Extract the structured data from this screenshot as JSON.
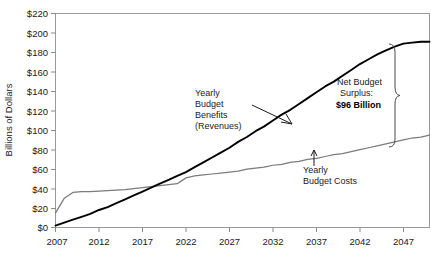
{
  "chart_data": {
    "type": "line",
    "title": "",
    "xlabel": "",
    "ylabel": "Billions of Dollars",
    "xlim": [
      2007,
      2050
    ],
    "ylim": [
      0,
      220
    ],
    "grid": false,
    "legend_position": "none",
    "x_ticks": [
      "2007",
      "2012",
      "2017",
      "2022",
      "2027",
      "2032",
      "2037",
      "2042",
      "2047"
    ],
    "x_tick_values": [
      2007,
      2012,
      2017,
      2022,
      2027,
      2032,
      2037,
      2042,
      2047
    ],
    "y_ticks": [
      "$0",
      "$20",
      "$40",
      "$60",
      "$80",
      "$100",
      "$120",
      "$140",
      "$160",
      "$180",
      "$200",
      "$220"
    ],
    "y_tick_values": [
      0,
      20,
      40,
      60,
      80,
      100,
      120,
      140,
      160,
      180,
      200,
      220
    ],
    "x": [
      2007,
      2008,
      2009,
      2010,
      2011,
      2012,
      2013,
      2014,
      2015,
      2016,
      2017,
      2018,
      2019,
      2020,
      2021,
      2022,
      2023,
      2024,
      2025,
      2026,
      2027,
      2028,
      2029,
      2030,
      2031,
      2032,
      2033,
      2034,
      2035,
      2036,
      2037,
      2038,
      2039,
      2040,
      2041,
      2042,
      2043,
      2044,
      2045,
      2046,
      2047,
      2048,
      2049,
      2050
    ],
    "series": [
      {
        "name": "Yearly Budget Benefits (Revenues)",
        "color": "#000000",
        "values": [
          2,
          5,
          8,
          11,
          14,
          18,
          21,
          25,
          29,
          33,
          37,
          41,
          45,
          49,
          53,
          57,
          62,
          67,
          72,
          77,
          82,
          88,
          93,
          99,
          104,
          110,
          116,
          121,
          127,
          133,
          139,
          145,
          150,
          156,
          162,
          168,
          173,
          178,
          182,
          186,
          189,
          190,
          191,
          191
        ]
      },
      {
        "name": "Yearly Budget Costs",
        "color": "#7b7b7b",
        "values": [
          15,
          30,
          36,
          37,
          37,
          37.5,
          38,
          38.5,
          39,
          40,
          41,
          42,
          43,
          44,
          45,
          51,
          53,
          54,
          55,
          56,
          57,
          58,
          60,
          61,
          62,
          64,
          65,
          67,
          68,
          70,
          71,
          73,
          75,
          76,
          78,
          80,
          82,
          84,
          86,
          88,
          90,
          92,
          93,
          95
        ]
      }
    ],
    "annotations": [
      {
        "name": "benefits-label",
        "lines": [
          "Yearly",
          "Budget",
          "Benefits",
          "(Revenues)"
        ],
        "points_to_series": "Yearly Budget Benefits (Revenues)"
      },
      {
        "name": "costs-label",
        "lines": [
          "Yearly",
          "Budget Costs"
        ],
        "points_to_series": "Yearly Budget Costs"
      },
      {
        "name": "surplus-callout",
        "lines": [
          "Net Budget",
          "Surplus:"
        ],
        "value_label": "$96 Billion",
        "value": 96
      }
    ]
  }
}
